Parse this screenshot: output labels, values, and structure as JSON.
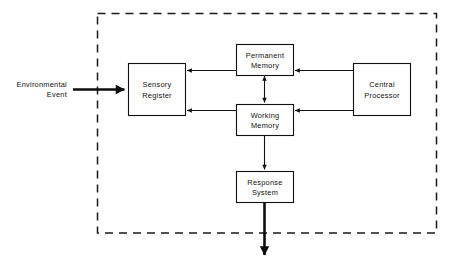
{
  "diagram": {
    "boundary": {
      "name": "system-boundary",
      "style": "dashed",
      "color": "#1a1a1a"
    },
    "nodes": [
      {
        "id": "sensory-register",
        "label_line1": "Sensory",
        "label_line2": "Register"
      },
      {
        "id": "permanent-memory",
        "label_line1": "Permanent",
        "label_line2": "Memory"
      },
      {
        "id": "working-memory",
        "label_line1": "Working",
        "label_line2": "Memory"
      },
      {
        "id": "central-processor",
        "label_line1": "Central",
        "label_line2": "Processor"
      },
      {
        "id": "response-system",
        "label_line1": "Response",
        "label_line2": "System"
      }
    ],
    "external_labels": [
      {
        "id": "environmental-event",
        "label_line1": "Environmental",
        "label_line2": "Event"
      }
    ],
    "edges": [
      {
        "id": "environmental-event-to-sensory-register",
        "from": "environmental-event",
        "to": "sensory-register",
        "direction": "forward",
        "weight": "thick"
      },
      {
        "id": "permanent-memory-to-sensory-register",
        "from": "permanent-memory",
        "to": "sensory-register",
        "direction": "forward",
        "weight": "thin"
      },
      {
        "id": "working-memory-to-sensory-register",
        "from": "working-memory",
        "to": "sensory-register",
        "direction": "forward",
        "weight": "thin"
      },
      {
        "id": "central-processor-to-permanent-memory",
        "from": "central-processor",
        "to": "permanent-memory",
        "direction": "forward",
        "weight": "thin"
      },
      {
        "id": "central-processor-to-working-memory",
        "from": "central-processor",
        "to": "working-memory",
        "direction": "forward",
        "weight": "thin"
      },
      {
        "id": "permanent-memory-working-memory",
        "from": "permanent-memory",
        "to": "working-memory",
        "direction": "bidirectional",
        "weight": "thin"
      },
      {
        "id": "working-memory-to-response-system",
        "from": "working-memory",
        "to": "response-system",
        "direction": "forward",
        "weight": "thin"
      },
      {
        "id": "response-system-to-output",
        "from": "response-system",
        "to": "output",
        "direction": "forward",
        "weight": "thick"
      }
    ]
  },
  "colors": {
    "ink": "#111111",
    "boundary": "#1a1a1a",
    "background": "#ffffff"
  }
}
